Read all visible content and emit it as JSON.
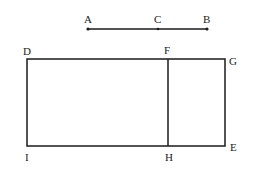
{
  "diagram": {
    "type": "geometry-figure",
    "colors": {
      "stroke": "#1a1a1a",
      "text": "#222222",
      "background": "#ffffff"
    },
    "segment": {
      "points": [
        {
          "label": "A",
          "x": 88,
          "y": 29
        },
        {
          "label": "C",
          "x": 158,
          "y": 29
        },
        {
          "label": "B",
          "x": 207,
          "y": 29
        }
      ]
    },
    "rectangle": {
      "vertices": [
        {
          "label": "D",
          "x": 27,
          "y": 59
        },
        {
          "label": "F",
          "x": 168,
          "y": 59
        },
        {
          "label": "G",
          "x": 225,
          "y": 59
        },
        {
          "label": "E",
          "x": 225,
          "y": 146
        },
        {
          "label": "H",
          "x": 168,
          "y": 146
        },
        {
          "label": "I",
          "x": 27,
          "y": 146
        }
      ],
      "divider": "FH"
    },
    "labels": {
      "A": "A",
      "B": "B",
      "C": "C",
      "D": "D",
      "E": "E",
      "F": "F",
      "G": "G",
      "H": "H",
      "I": "I"
    }
  }
}
